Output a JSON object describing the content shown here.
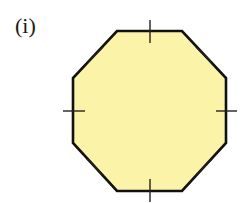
{
  "figure": {
    "label": "(i)",
    "shape": "regular-octagon",
    "fill_color": "#FBF3A8",
    "stroke_color": "#111111",
    "tick_color": "#222222",
    "vertices": [
      [
        117,
        31
      ],
      [
        182,
        31
      ],
      [
        226,
        78
      ],
      [
        226,
        143
      ],
      [
        182,
        191
      ],
      [
        117,
        191
      ],
      [
        73,
        143
      ],
      [
        73,
        78
      ]
    ],
    "equal_side_tick_marks": 8,
    "ticks": [
      {
        "side": "top",
        "x1": 150,
        "y1": 20,
        "x2": 150,
        "y2": 43
      },
      {
        "side": "upper-right",
        "x1": 196,
        "y1": 47,
        "x2": 212,
        "y2": 63
      },
      {
        "side": "right",
        "x1": 216,
        "y1": 111,
        "x2": 237,
        "y2": 111
      },
      {
        "side": "lower-right",
        "x1": 196,
        "y1": 175,
        "x2": 212,
        "y2": 159
      },
      {
        "side": "bottom",
        "x1": 150,
        "y1": 179,
        "x2": 150,
        "y2": 202
      },
      {
        "side": "lower-left",
        "x1": 87,
        "y1": 159,
        "x2": 103,
        "y2": 175
      },
      {
        "side": "left",
        "x1": 63,
        "y1": 111,
        "x2": 85,
        "y2": 111
      },
      {
        "side": "upper-left",
        "x1": 87,
        "y1": 63,
        "x2": 103,
        "y2": 47
      }
    ]
  }
}
